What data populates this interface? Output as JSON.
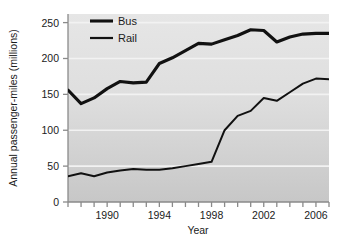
{
  "chart_data": {
    "type": "line",
    "title": "",
    "xlabel": "Year",
    "ylabel": "Annual passenger-miles (millions)",
    "xlim": [
      1987,
      2007
    ],
    "ylim": [
      0,
      262
    ],
    "grid": true,
    "legend_position": "top-left",
    "xticks": [
      1987,
      1988,
      1989,
      1990,
      1991,
      1992,
      1993,
      1994,
      1995,
      1996,
      1997,
      1998,
      1999,
      2000,
      2001,
      2002,
      2003,
      2004,
      2005,
      2006,
      2007
    ],
    "xtick_labels": [
      "",
      "",
      "",
      "1990",
      "",
      "",
      "",
      "1994",
      "",
      "",
      "",
      "1998",
      "",
      "",
      "",
      "2002",
      "",
      "",
      "",
      "2006",
      ""
    ],
    "yticks": [
      0,
      50,
      100,
      150,
      200,
      250
    ],
    "ytick_labels": [
      "0",
      "50",
      "100",
      "150",
      "200",
      "250"
    ],
    "x": [
      1987,
      1988,
      1989,
      1990,
      1991,
      1992,
      1993,
      1994,
      1995,
      1996,
      1997,
      1998,
      1999,
      2000,
      2001,
      2002,
      2003,
      2004,
      2005,
      2006,
      2007
    ],
    "series": [
      {
        "name": "Bus",
        "color": "#111111",
        "width": 3.1,
        "values": [
          156,
          137,
          145,
          158,
          168,
          166,
          167,
          193,
          201,
          211,
          221,
          220,
          226,
          232,
          240,
          239,
          223,
          230,
          234,
          235,
          235
        ]
      },
      {
        "name": "Rail",
        "color": "#111111",
        "width": 2.0,
        "values": [
          36,
          40,
          36,
          41,
          44,
          46,
          45,
          45,
          47,
          50,
          53,
          56,
          100,
          120,
          127,
          145,
          141,
          153,
          165,
          172,
          171
        ]
      }
    ]
  },
  "legend": {
    "items": [
      {
        "label": "Bus"
      },
      {
        "label": "Rail"
      }
    ]
  },
  "colors": {
    "plot_background_top": "#e3e3e3",
    "plot_background_bottom": "#c9c9c9",
    "gridline": "#f2f2f2",
    "axis": "#8a8a8a",
    "text": "#1b1b1b"
  },
  "footnote": {
    "text": ""
  }
}
